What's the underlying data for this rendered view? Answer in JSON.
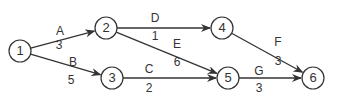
{
  "nodes": [
    {
      "id": "1",
      "x": 20,
      "y": 51
    },
    {
      "id": "2",
      "x": 106,
      "y": 28
    },
    {
      "id": "3",
      "x": 112,
      "y": 78
    },
    {
      "id": "4",
      "x": 222,
      "y": 28
    },
    {
      "id": "5",
      "x": 228,
      "y": 78
    },
    {
      "id": "6",
      "x": 313,
      "y": 78
    }
  ],
  "edges": [
    {
      "from": "1",
      "to": "2",
      "activity": "A",
      "duration": "3",
      "ax": 60,
      "ay": 31,
      "dx": 59,
      "dy": 45
    },
    {
      "from": "1",
      "to": "3",
      "activity": "B",
      "duration": "5",
      "ax": 73,
      "ay": 62,
      "dx": 71,
      "dy": 80
    },
    {
      "from": "3",
      "to": "5",
      "activity": "C",
      "duration": "2",
      "ax": 149,
      "ay": 69,
      "dx": 149,
      "dy": 88
    },
    {
      "from": "2",
      "to": "4",
      "activity": "D",
      "duration": "1",
      "ax": 155,
      "ay": 18,
      "dx": 155,
      "dy": 36
    },
    {
      "from": "2",
      "to": "5",
      "activity": "E",
      "duration": "6",
      "ax": 177,
      "ay": 44,
      "dx": 177,
      "dy": 62
    },
    {
      "from": "4",
      "to": "6",
      "activity": "F",
      "duration": "3",
      "ax": 278,
      "ay": 42,
      "dx": 278,
      "dy": 61
    },
    {
      "from": "5",
      "to": "6",
      "activity": "G",
      "duration": "3",
      "ax": 259,
      "ay": 71,
      "dx": 259,
      "dy": 88
    }
  ],
  "colors": {
    "stroke": "#333333",
    "text": "#333333"
  }
}
